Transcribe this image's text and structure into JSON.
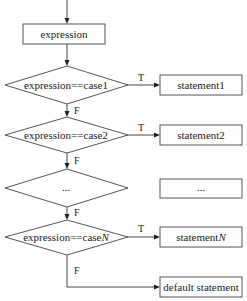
{
  "diagram": {
    "type": "flowchart",
    "nodes": {
      "expression": {
        "label": "expression"
      },
      "cond1": {
        "label": "expression==case1"
      },
      "cond2": {
        "label": "expression==case2"
      },
      "cond3": {
        "label": "..."
      },
      "condN": {
        "label_prefix": "expression==case",
        "label_italic": "N"
      },
      "stmt1": {
        "label": "statement1"
      },
      "stmt2": {
        "label": "statement2"
      },
      "stmt3": {
        "label": "..."
      },
      "stmtN": {
        "label_prefix": "statement",
        "label_italic": "N"
      },
      "default": {
        "label": "default statement"
      }
    },
    "edges": {
      "true_label": "T",
      "false_label": "F"
    },
    "colors": {
      "stroke": "#555555",
      "text": "#222222",
      "background": "#ffffff"
    }
  }
}
